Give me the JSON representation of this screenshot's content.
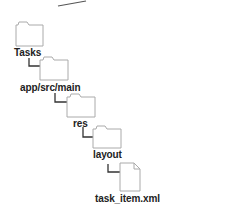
{
  "diagram": {
    "type": "directory-tree",
    "nodes": [
      {
        "label": "Tasks",
        "kind": "folder",
        "depth": 0
      },
      {
        "label": "app/src/main",
        "kind": "folder",
        "depth": 1
      },
      {
        "label": "res",
        "kind": "folder",
        "depth": 2
      },
      {
        "label": "layout",
        "kind": "folder",
        "depth": 3
      },
      {
        "label": "task_item.xml",
        "kind": "file",
        "depth": 4
      }
    ],
    "colors": {
      "outline": "#aaaaaa",
      "connector": "#333333",
      "fill": "#ffffff",
      "text": "#222222"
    }
  }
}
